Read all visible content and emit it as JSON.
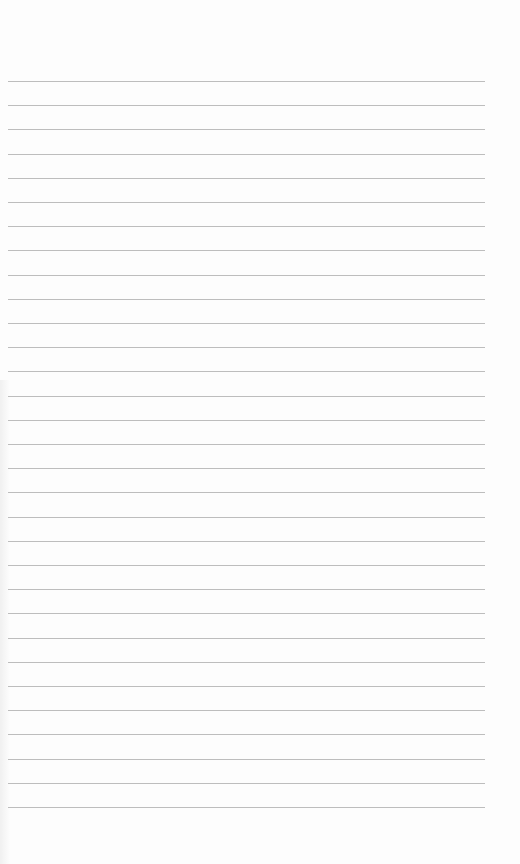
{
  "page": {
    "type": "blank lined notebook page",
    "background_color": "#fdfdfd",
    "line_color": "#bdbdbd",
    "line_count": 31,
    "first_line_y": 81,
    "line_spacing": 24.2,
    "line_left": 8,
    "line_right": 485
  }
}
